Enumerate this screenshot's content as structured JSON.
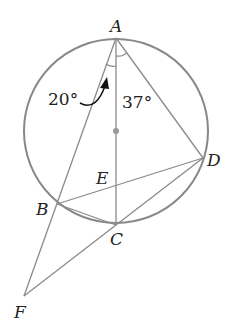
{
  "diagram": {
    "type": "circle-geometry",
    "colors": {
      "line": "#8a8a8a",
      "circle": "#888888",
      "text": "#222222",
      "center_dot": "#999999",
      "arrow": "#111111"
    },
    "circle": {
      "cx": 116,
      "cy": 131,
      "r": 92
    },
    "points": {
      "A": {
        "label": "A",
        "x": 116,
        "y": 38
      },
      "B": {
        "label": "B",
        "x": 57,
        "y": 204
      },
      "C": {
        "label": "C",
        "x": 116,
        "y": 225
      },
      "D": {
        "label": "D",
        "x": 203,
        "y": 158
      },
      "E": {
        "label": "E",
        "x": 116,
        "y": 185
      },
      "F": {
        "label": "F",
        "x": 24,
        "y": 296
      }
    },
    "segments": [
      "AF",
      "AC",
      "AD",
      "BD",
      "BC",
      "CD",
      "FC"
    ],
    "angles": {
      "FAC": {
        "label": "20°"
      },
      "CAD": {
        "label": "37°"
      }
    }
  }
}
